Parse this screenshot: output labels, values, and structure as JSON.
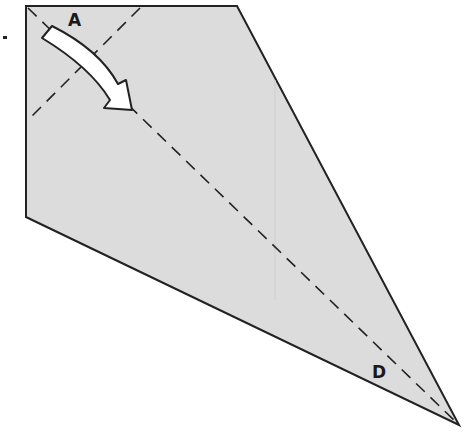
{
  "diagram": {
    "type": "origami-fold-step",
    "paper_color": "#dcdcdc",
    "line_color": "#222222",
    "labels": {
      "corner_a": "A",
      "corner_d": "D"
    },
    "fold_action": "fold corner A along dashed diagonal toward D",
    "shape_vertices": [
      [
        26,
        6
      ],
      [
        237,
        6
      ],
      [
        459,
        425
      ],
      [
        26,
        217
      ]
    ]
  }
}
